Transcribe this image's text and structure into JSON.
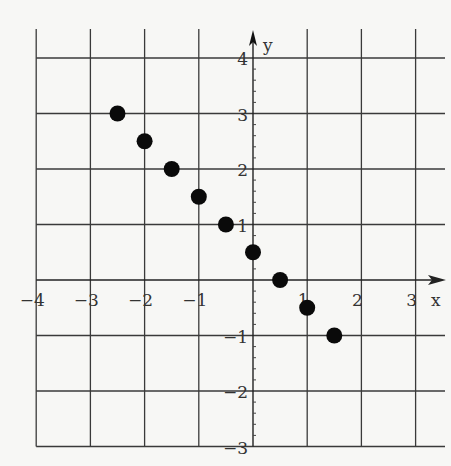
{
  "chart_data": {
    "type": "scatter",
    "title": "",
    "xlabel": "x",
    "ylabel": "y",
    "xlim": [
      -4,
      3
    ],
    "ylim": [
      -3,
      4
    ],
    "x_ticks": [
      -4,
      -3,
      -2,
      -1,
      1,
      2,
      3
    ],
    "y_ticks": [
      4,
      3,
      2,
      1,
      -1,
      -2,
      -3
    ],
    "x_tick_labels": [
      "-4",
      "-3",
      "-2",
      "-1",
      "1",
      "2",
      "3"
    ],
    "y_tick_labels": [
      "4",
      "3",
      "2",
      "1",
      "-1",
      "-2",
      "-3"
    ],
    "grid": true,
    "minor_ticks_on_y_axis": 0.2,
    "series": [
      {
        "name": "points",
        "x": [
          -2.5,
          -2,
          -1.5,
          -1,
          -0.5,
          0,
          0.5,
          1,
          1.5
        ],
        "y": [
          3,
          2.5,
          2,
          1.5,
          1,
          0.5,
          0,
          -0.5,
          -1
        ]
      }
    ],
    "point_color": "#0a0a0a"
  }
}
